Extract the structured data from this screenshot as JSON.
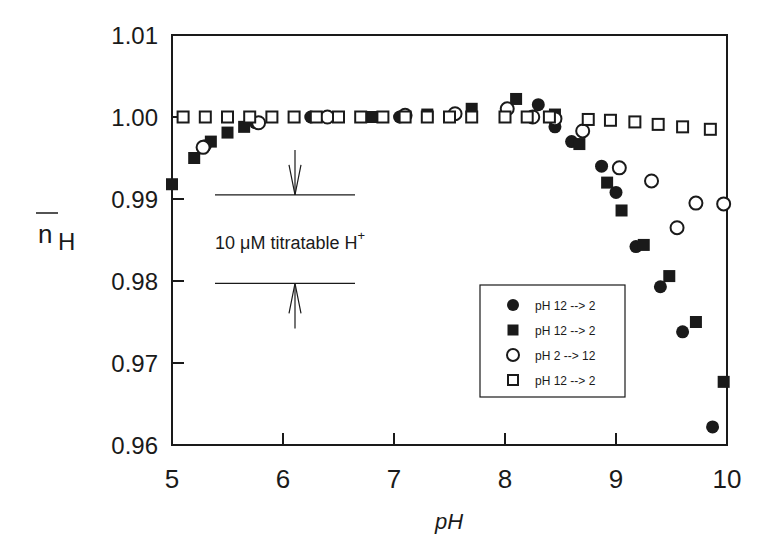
{
  "chart_data": {
    "type": "scatter",
    "title": "",
    "xlabel": "pH",
    "ylabel": "n̄H",
    "ylabel_main": "n",
    "ylabel_sub": "H",
    "xlim": [
      5,
      10
    ],
    "ylim": [
      0.96,
      1.01
    ],
    "grid": false,
    "legend_position": "lower right (inside)",
    "x_ticks": [
      "5",
      "6",
      "7",
      "8",
      "9",
      "10"
    ],
    "y_ticks": [
      "0.96",
      "0.97",
      "0.98",
      "0.99",
      "1.00",
      "1.01"
    ],
    "annotation": {
      "text": "10 μM titratable H",
      "superscript": "+",
      "upper_line_y": 0.9905,
      "lower_line_y": 0.9797,
      "x_range": [
        5.3,
        6.65
      ]
    },
    "series": [
      {
        "name": "pH 12 --> 2",
        "marker": "filled-circle",
        "points": [
          [
            5.3,
            0.9965
          ],
          [
            5.75,
            0.9993
          ],
          [
            6.25,
            1.0
          ],
          [
            7.05,
            1.0
          ],
          [
            8.3,
            1.0015
          ],
          [
            8.45,
            0.9988
          ],
          [
            8.6,
            0.997
          ],
          [
            8.87,
            0.994
          ],
          [
            9.0,
            0.9908
          ],
          [
            9.18,
            0.9842
          ],
          [
            9.4,
            0.9793
          ],
          [
            9.6,
            0.9738
          ],
          [
            9.87,
            0.9622
          ]
        ]
      },
      {
        "name": "pH 12 --> 2",
        "marker": "filled-square",
        "points": [
          [
            5.0,
            0.9918
          ],
          [
            5.2,
            0.995
          ],
          [
            5.35,
            0.997
          ],
          [
            5.5,
            0.9981
          ],
          [
            5.65,
            0.9988
          ],
          [
            6.3,
            1.0
          ],
          [
            6.8,
            1.0
          ],
          [
            7.3,
            1.0003
          ],
          [
            7.7,
            1.001
          ],
          [
            8.1,
            1.0022
          ],
          [
            8.45,
            1.0003
          ],
          [
            8.67,
            0.9967
          ],
          [
            8.92,
            0.992
          ],
          [
            9.05,
            0.9886
          ],
          [
            9.25,
            0.9844
          ],
          [
            9.48,
            0.9806
          ],
          [
            9.72,
            0.975
          ],
          [
            9.97,
            0.9677
          ]
        ]
      },
      {
        "name": "pH 2 --> 12",
        "marker": "open-circle",
        "points": [
          [
            5.28,
            0.9963
          ],
          [
            5.78,
            0.9993
          ],
          [
            6.4,
            1.0
          ],
          [
            7.1,
            1.0002
          ],
          [
            7.55,
            1.0004
          ],
          [
            8.02,
            1.001
          ],
          [
            8.25,
            1.0
          ],
          [
            8.45,
            0.9998
          ],
          [
            8.7,
            0.9983
          ],
          [
            9.03,
            0.9938
          ],
          [
            9.32,
            0.9922
          ],
          [
            9.55,
            0.9865
          ],
          [
            9.72,
            0.9895
          ],
          [
            9.97,
            0.9894
          ]
        ]
      },
      {
        "name": "pH 12 --> 2",
        "marker": "open-square",
        "points": [
          [
            5.1,
            1.0
          ],
          [
            5.3,
            1.0
          ],
          [
            5.5,
            1.0
          ],
          [
            5.7,
            1.0
          ],
          [
            5.9,
            1.0
          ],
          [
            6.1,
            1.0
          ],
          [
            6.3,
            1.0
          ],
          [
            6.5,
            1.0
          ],
          [
            6.7,
            1.0
          ],
          [
            6.9,
            1.0
          ],
          [
            7.1,
            1.0
          ],
          [
            7.3,
            1.0
          ],
          [
            7.5,
            1.0
          ],
          [
            7.7,
            1.0
          ],
          [
            8.0,
            1.0
          ],
          [
            8.2,
            1.0
          ],
          [
            8.4,
            1.0
          ],
          [
            8.75,
            0.9997
          ],
          [
            8.95,
            0.9996
          ],
          [
            9.17,
            0.9994
          ],
          [
            9.38,
            0.9991
          ],
          [
            9.6,
            0.9988
          ],
          [
            9.85,
            0.9985
          ]
        ]
      }
    ]
  },
  "legend": {
    "items": [
      {
        "label": "pH 12 --> 2",
        "marker": "filled-circle"
      },
      {
        "label": "pH 12 --> 2",
        "marker": "filled-square"
      },
      {
        "label": "pH 2 --> 12",
        "marker": "open-circle"
      },
      {
        "label": "pH 12 --> 2",
        "marker": "open-square"
      }
    ]
  },
  "colors": {
    "ink": "#1a1a1a",
    "background": "#ffffff"
  }
}
